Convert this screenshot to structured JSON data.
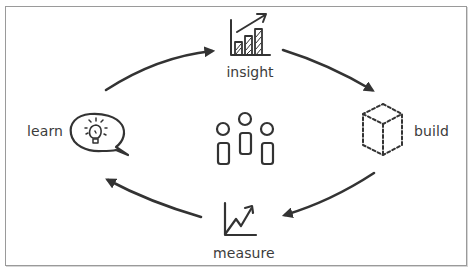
{
  "diagram": {
    "title": "",
    "center": {
      "icon": "team-people-icon"
    },
    "nodes": [
      {
        "id": "insight",
        "label": "insight",
        "icon": "bar-chart-trend-icon"
      },
      {
        "id": "build",
        "label": "build",
        "icon": "dashed-cube-icon"
      },
      {
        "id": "measure",
        "label": "measure",
        "icon": "line-graph-arrow-icon"
      },
      {
        "id": "learn",
        "label": "learn",
        "icon": "speech-bubble-lightbulb-icon"
      }
    ],
    "edges": [
      {
        "from": "learn",
        "to": "insight"
      },
      {
        "from": "insight",
        "to": "build"
      },
      {
        "from": "build",
        "to": "measure"
      },
      {
        "from": "measure",
        "to": "learn"
      }
    ],
    "colors": {
      "stroke": "#333333",
      "text": "#3c3c3c",
      "border": "#9a9a9a",
      "background": "#ffffff"
    }
  }
}
